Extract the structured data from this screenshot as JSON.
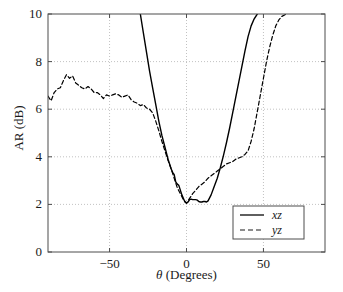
{
  "chart_data": {
    "type": "line",
    "title": "",
    "xlabel": "θ (Degrees)",
    "ylabel": "AR (dB)",
    "xlim": [
      -90,
      90
    ],
    "ylim": [
      0,
      10
    ],
    "xticks": [
      -50,
      0,
      50
    ],
    "xtick_labels": [
      "−50",
      "0",
      "50"
    ],
    "yticks": [
      0,
      2,
      4,
      6,
      8,
      10
    ],
    "ytick_labels": [
      "0",
      "2",
      "4",
      "6",
      "8",
      "10"
    ],
    "grid": true,
    "grid_style": "dotted",
    "legend_position": "lower right",
    "series": [
      {
        "name": "xz",
        "style": "solid",
        "color": "#000000",
        "x": [
          -30,
          -28,
          -26,
          -24,
          -22,
          -20,
          -18,
          -16,
          -14,
          -12,
          -10,
          -9,
          -8,
          -7,
          -6,
          -5,
          -4,
          -3,
          -2,
          -1,
          0,
          1,
          2,
          3,
          4,
          5,
          6,
          7,
          8,
          9,
          10,
          11,
          12,
          13,
          14,
          16,
          18,
          20,
          22,
          24,
          26,
          28,
          30,
          32,
          34,
          36,
          38,
          40,
          42,
          44,
          46
        ],
        "y": [
          10.0,
          9.2,
          8.4,
          7.6,
          6.9,
          6.2,
          5.5,
          4.9,
          4.4,
          3.9,
          3.5,
          3.35,
          3.25,
          2.95,
          2.85,
          2.8,
          2.6,
          2.4,
          2.25,
          2.1,
          2.05,
          2.1,
          2.2,
          2.22,
          2.2,
          2.2,
          2.2,
          2.18,
          2.12,
          2.1,
          2.1,
          2.12,
          2.12,
          2.1,
          2.15,
          2.4,
          2.75,
          3.1,
          3.55,
          4.05,
          4.6,
          5.2,
          5.85,
          6.5,
          7.15,
          7.8,
          8.45,
          9.05,
          9.5,
          9.8,
          10.0
        ]
      },
      {
        "name": "yz",
        "style": "dashed",
        "color": "#000000",
        "x": [
          -90,
          -88,
          -86,
          -84,
          -82,
          -80,
          -78,
          -76,
          -74,
          -72,
          -70,
          -68,
          -66,
          -64,
          -62,
          -60,
          -58,
          -56,
          -54,
          -52,
          -50,
          -48,
          -46,
          -44,
          -42,
          -40,
          -38,
          -36,
          -34,
          -32,
          -30,
          -28,
          -26,
          -24,
          -22,
          -20,
          -18,
          -16,
          -14,
          -12,
          -10,
          -8,
          -6,
          -4,
          -2,
          0,
          2,
          4,
          6,
          8,
          10,
          12,
          14,
          16,
          18,
          20,
          22,
          24,
          26,
          28,
          30,
          32,
          34,
          36,
          38,
          40,
          42,
          44,
          46,
          48,
          50,
          52,
          54,
          56,
          58,
          60,
          62,
          64,
          65
        ],
        "y": [
          6.55,
          6.35,
          6.7,
          6.85,
          6.9,
          7.2,
          7.45,
          7.3,
          7.4,
          7.1,
          7.0,
          6.9,
          6.85,
          6.95,
          6.85,
          6.7,
          6.7,
          6.6,
          6.45,
          6.6,
          6.55,
          6.6,
          6.65,
          6.6,
          6.5,
          6.55,
          6.6,
          6.4,
          6.3,
          6.25,
          6.15,
          6.2,
          6.05,
          6.0,
          5.85,
          5.5,
          5.1,
          4.65,
          4.25,
          3.85,
          3.5,
          3.1,
          2.7,
          2.45,
          2.2,
          2.05,
          2.25,
          2.45,
          2.6,
          2.75,
          2.85,
          2.95,
          3.1,
          3.2,
          3.3,
          3.4,
          3.5,
          3.6,
          3.7,
          3.75,
          3.8,
          3.9,
          3.95,
          4.0,
          4.1,
          4.25,
          4.65,
          5.2,
          5.9,
          6.6,
          7.3,
          8.0,
          8.6,
          9.1,
          9.5,
          9.75,
          9.9,
          9.97,
          10.0
        ]
      }
    ]
  },
  "legend": {
    "items": [
      {
        "label": "xz",
        "style": "solid"
      },
      {
        "label": "yz",
        "style": "dashed"
      }
    ]
  },
  "axes": {
    "x_label": "θ (Degrees)",
    "x_label_prefix": "θ",
    "x_label_suffix": " (Degrees)",
    "y_label": "AR (dB)"
  },
  "colors": {
    "axis": "#4d4d4d",
    "grid": "#b3b3b3",
    "curve": "#1a1a1a",
    "background": "#ffffff"
  }
}
